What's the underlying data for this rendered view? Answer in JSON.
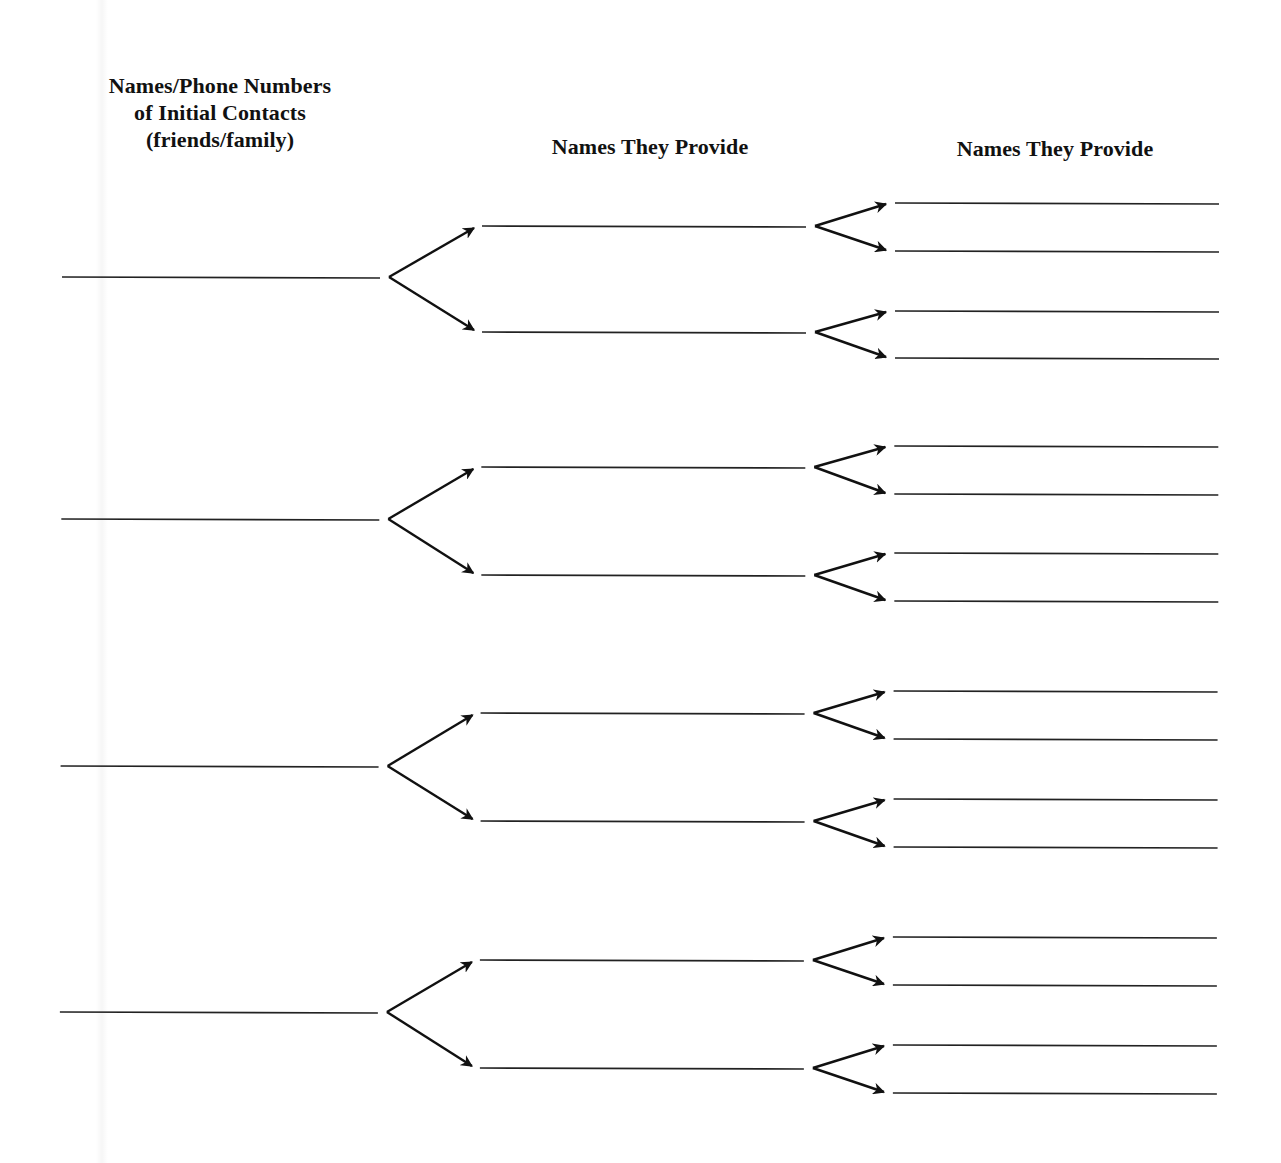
{
  "worksheet": {
    "columns": [
      {
        "header_lines": [
          "Names/Phone Numbers",
          "of Initial Contacts",
          "(friends/family)"
        ]
      },
      {
        "header": "Names They Provide"
      },
      {
        "header": "Names They Provide"
      }
    ],
    "colors": {
      "ink": "#111111",
      "paper": "#ffffff"
    },
    "structure": {
      "initial_contacts": 4,
      "branches_per_contact": 2,
      "branches_per_referral": 2,
      "total_level1_blanks": 4,
      "total_level2_blanks": 8,
      "total_level3_blanks": 16
    },
    "groups": [
      {
        "root_y": 277,
        "mid": [
          {
            "y": 226,
            "leaves": [
              203,
              251
            ]
          },
          {
            "y": 332,
            "leaves": [
              311,
              358
            ]
          }
        ]
      },
      {
        "root_y": 519,
        "mid": [
          {
            "y": 467,
            "leaves": [
              446,
              494
            ]
          },
          {
            "y": 575,
            "leaves": [
              553,
              601
            ]
          }
        ]
      },
      {
        "root_y": 766,
        "mid": [
          {
            "y": 713,
            "leaves": [
              691,
              739
            ]
          },
          {
            "y": 821,
            "leaves": [
              799,
              847
            ]
          }
        ]
      },
      {
        "root_y": 1012,
        "mid": [
          {
            "y": 960,
            "leaves": [
              937,
              985
            ]
          },
          {
            "y": 1068,
            "leaves": [
              1045,
              1093
            ]
          }
        ]
      }
    ]
  }
}
